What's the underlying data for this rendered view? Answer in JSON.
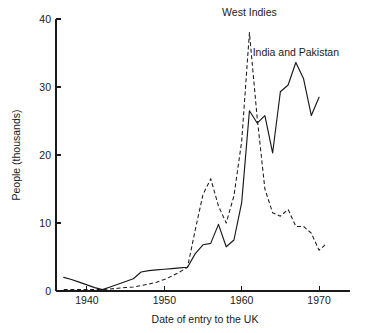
{
  "chart_data": {
    "type": "line",
    "title": "",
    "xlabel": "Date of entry to the UK",
    "ylabel": "People (thousands)",
    "xlim": [
      1936,
      1974
    ],
    "ylim": [
      0,
      40
    ],
    "xticks": [
      1940,
      1950,
      1960,
      1970
    ],
    "xtick_labels": [
      "1940",
      "1950",
      "1960",
      "1970"
    ],
    "yticks": [
      0,
      10,
      20,
      30,
      40
    ],
    "ytick_labels": [
      "0",
      "10",
      "20",
      "30",
      "40"
    ],
    "grid": false,
    "legend_position": "inline-annotations",
    "series": [
      {
        "name": "West Indies",
        "style": "dashed",
        "color": "#1a1a1a",
        "label_x": 1961,
        "label_y": 40.5,
        "x": [
          1937,
          1938,
          1939,
          1940,
          1941,
          1942,
          1943,
          1944,
          1945,
          1946,
          1947,
          1948,
          1949,
          1950,
          1951,
          1952,
          1953,
          1954,
          1955,
          1956,
          1957,
          1958,
          1959,
          1960,
          1961,
          1962,
          1963,
          1964,
          1965,
          1966,
          1967,
          1968,
          1969,
          1970,
          1971
        ],
        "values": [
          0.2,
          0.2,
          0.2,
          0.2,
          0.2,
          0.2,
          0.3,
          0.4,
          0.5,
          0.6,
          0.8,
          1.0,
          1.3,
          1.7,
          2.2,
          2.8,
          3.5,
          9.0,
          14.2,
          16.5,
          12.5,
          10.0,
          14.0,
          22.0,
          38.0,
          25.5,
          15.0,
          11.5,
          11.0,
          12.0,
          9.5,
          9.5,
          8.5,
          6.0,
          7.0
        ]
      },
      {
        "name": "India and Pakistan",
        "style": "solid",
        "color": "#1a1a1a",
        "label_x": 1967,
        "label_y": 34.5,
        "x": [
          1937,
          1938,
          1939,
          1940,
          1941,
          1942,
          1943,
          1944,
          1945,
          1946,
          1947,
          1948,
          1949,
          1950,
          1951,
          1952,
          1953,
          1954,
          1955,
          1956,
          1957,
          1958,
          1959,
          1960,
          1961,
          1962,
          1963,
          1964,
          1965,
          1966,
          1967,
          1968,
          1969,
          1970
        ],
        "values": [
          2.0,
          1.7,
          1.3,
          0.9,
          0.5,
          0.2,
          0.6,
          1.0,
          1.4,
          1.8,
          2.8,
          3.0,
          3.1,
          3.2,
          3.3,
          3.4,
          3.5,
          5.5,
          6.8,
          7.0,
          9.8,
          6.5,
          7.5,
          13.0,
          26.5,
          24.7,
          25.8,
          20.3,
          29.3,
          30.3,
          33.6,
          31.2,
          25.8,
          28.5
        ]
      }
    ],
    "annotations": [
      {
        "text": "West Indies",
        "series": "West Indies"
      },
      {
        "text": "India and Pakistan",
        "series": "India and Pakistan"
      }
    ]
  },
  "axes": {
    "y_axis_label": "People (thousands)",
    "x_axis_label": "Date of entry to the UK"
  }
}
